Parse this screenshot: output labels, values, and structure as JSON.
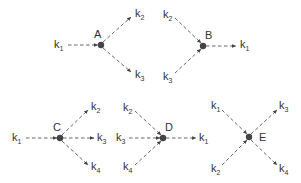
{
  "diagram": {
    "colors": {
      "edge": "#555555",
      "node": "#444444",
      "text": "#333333",
      "background": "#ffffff"
    },
    "nodes": {
      "A": {
        "label": "A",
        "x": 101,
        "y": 45
      },
      "B": {
        "label": "B",
        "x": 203,
        "y": 46
      },
      "C": {
        "label": "C",
        "x": 60,
        "y": 138
      },
      "D": {
        "label": "D",
        "x": 163,
        "y": 138
      },
      "E": {
        "label": "E",
        "x": 249,
        "y": 137
      }
    },
    "terminals": {
      "A_k1": {
        "base": "k",
        "sub": "1"
      },
      "A_k2": {
        "base": "k",
        "sub": "2"
      },
      "A_k3": {
        "base": "k",
        "sub": "3"
      },
      "B_k2": {
        "base": "k",
        "sub": "2"
      },
      "B_k3": {
        "base": "k",
        "sub": "3"
      },
      "B_k1": {
        "base": "k",
        "sub": "1"
      },
      "C_k1": {
        "base": "k",
        "sub": "1"
      },
      "C_k2": {
        "base": "k",
        "sub": "2"
      },
      "C_k3": {
        "base": "k",
        "sub": "3"
      },
      "C_k4": {
        "base": "k",
        "sub": "4"
      },
      "D_k2": {
        "base": "k",
        "sub": "2"
      },
      "D_k3": {
        "base": "k",
        "sub": "3"
      },
      "D_k4": {
        "base": "k",
        "sub": "4"
      },
      "D_k1": {
        "base": "k",
        "sub": "1"
      },
      "E_k1": {
        "base": "k",
        "sub": "1"
      },
      "E_k2": {
        "base": "k",
        "sub": "2"
      },
      "E_k3": {
        "base": "k",
        "sub": "3"
      },
      "E_k4": {
        "base": "k",
        "sub": "4"
      }
    },
    "edges": [
      {
        "vertex": "A",
        "from": "k1",
        "to": "A"
      },
      {
        "vertex": "A",
        "from": "A",
        "to": "k2"
      },
      {
        "vertex": "A",
        "from": "A",
        "to": "k3"
      },
      {
        "vertex": "B",
        "from": "k2",
        "to": "B"
      },
      {
        "vertex": "B",
        "from": "k3",
        "to": "B"
      },
      {
        "vertex": "B",
        "from": "B",
        "to": "k1"
      },
      {
        "vertex": "C",
        "from": "k1",
        "to": "C"
      },
      {
        "vertex": "C",
        "from": "C",
        "to": "k2"
      },
      {
        "vertex": "C",
        "from": "C",
        "to": "k3"
      },
      {
        "vertex": "C",
        "from": "C",
        "to": "k4"
      },
      {
        "vertex": "D",
        "from": "k2",
        "to": "D"
      },
      {
        "vertex": "D",
        "from": "k3",
        "to": "D"
      },
      {
        "vertex": "D",
        "from": "k4",
        "to": "D"
      },
      {
        "vertex": "D",
        "from": "D",
        "to": "k1"
      },
      {
        "vertex": "E",
        "from": "k1",
        "to": "E"
      },
      {
        "vertex": "E",
        "from": "k2",
        "to": "E"
      },
      {
        "vertex": "E",
        "from": "E",
        "to": "k3"
      },
      {
        "vertex": "E",
        "from": "E",
        "to": "k4"
      }
    ]
  }
}
